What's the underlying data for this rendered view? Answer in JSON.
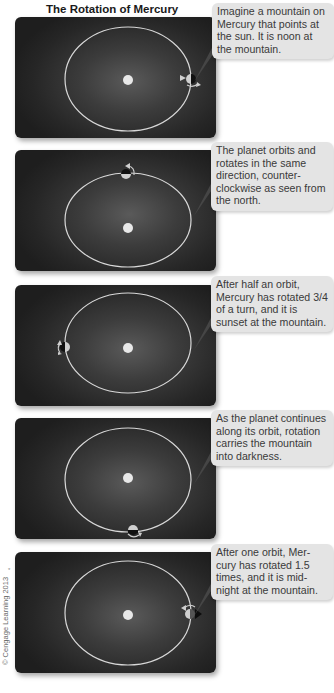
{
  "title": "The Rotation of Mercury",
  "credit": "© Cengage Learning 2013",
  "colors": {
    "panel_bg": "#262626",
    "orbit": "#d8d8d8",
    "sun": "#e8e8e8",
    "callout_bg": "#e4e4e4",
    "callout_text": "#3a3a3a"
  },
  "panels": [
    {
      "step": 1,
      "planet_position": "right of orbit (noon)",
      "caption": "Imagine a mountain on Mercury that points at the sun. It is noon at the mountain."
    },
    {
      "step": 2,
      "planet_position": "top of orbit",
      "caption": "The planet orbits and rotates in the same direction, counter-clockwise as seen from the north."
    },
    {
      "step": 3,
      "planet_position": "left of orbit (sunset)",
      "caption": "After half an orbit, Mercury has rotated 3/4 of a turn, and it is sunset at the mountain."
    },
    {
      "step": 4,
      "planet_position": "bottom of orbit",
      "caption": "As the planet continues along its orbit, rotation carries the mountain into darkness."
    },
    {
      "step": 5,
      "planet_position": "right of orbit (midnight)",
      "caption": "After one orbit, Mer-cury has rotated 1.5 times, and it is mid-night at the mountain."
    }
  ]
}
